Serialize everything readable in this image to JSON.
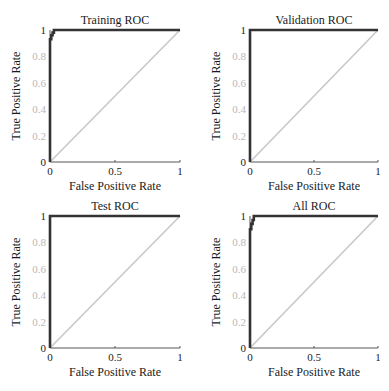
{
  "chart_data": [
    {
      "type": "line",
      "title": "Training ROC",
      "xlabel": "False Positive Rate",
      "ylabel": "True Positive Rate",
      "xlim": [
        0,
        1
      ],
      "ylim": [
        0,
        1
      ],
      "xticks": [
        "0",
        "0.5",
        "1"
      ],
      "yticks": [
        "0",
        "0.2",
        "0.4",
        "0.6",
        "0.8",
        "1"
      ],
      "grid": false,
      "series": [
        {
          "name": "ROC",
          "color": "#333333",
          "x": [
            0,
            0,
            0.01,
            0.01,
            0.02,
            0.02,
            0.03,
            0.03,
            1
          ],
          "y": [
            0,
            0.93,
            0.93,
            0.96,
            0.96,
            0.98,
            0.98,
            1,
            1
          ]
        },
        {
          "name": "Chance",
          "color": "#c8c8c8",
          "x": [
            0,
            1
          ],
          "y": [
            0,
            1
          ]
        }
      ]
    },
    {
      "type": "line",
      "title": "Validation ROC",
      "xlabel": "False Positive Rate",
      "ylabel": "True Positive Rate",
      "xlim": [
        0,
        1
      ],
      "ylim": [
        0,
        1
      ],
      "xticks": [
        "0",
        "0.5",
        "1"
      ],
      "yticks": [
        "0",
        "0.2",
        "0.4",
        "0.6",
        "0.8",
        "1"
      ],
      "grid": false,
      "series": [
        {
          "name": "ROC",
          "color": "#333333",
          "x": [
            0,
            0,
            1
          ],
          "y": [
            0,
            1,
            1
          ]
        },
        {
          "name": "Chance",
          "color": "#c8c8c8",
          "x": [
            0,
            1
          ],
          "y": [
            0,
            1
          ]
        }
      ]
    },
    {
      "type": "line",
      "title": "Test ROC",
      "xlabel": "False Positive Rate",
      "ylabel": "True Positive Rate",
      "xlim": [
        0,
        1
      ],
      "ylim": [
        0,
        1
      ],
      "xticks": [
        "0",
        "0.5",
        "1"
      ],
      "yticks": [
        "0",
        "0.2",
        "0.4",
        "0.6",
        "0.8",
        "1"
      ],
      "grid": false,
      "series": [
        {
          "name": "ROC",
          "color": "#333333",
          "x": [
            0,
            0,
            1
          ],
          "y": [
            0,
            1,
            1
          ]
        },
        {
          "name": "Chance",
          "color": "#c8c8c8",
          "x": [
            0,
            1
          ],
          "y": [
            0,
            1
          ]
        }
      ]
    },
    {
      "type": "line",
      "title": "All ROC",
      "xlabel": "False Positive Rate",
      "ylabel": "True Positive Rate",
      "xlim": [
        0,
        1
      ],
      "ylim": [
        0,
        1
      ],
      "xticks": [
        "0",
        "0.5",
        "1"
      ],
      "yticks": [
        "0",
        "0.2",
        "0.4",
        "0.6",
        "0.8",
        "1"
      ],
      "grid": false,
      "series": [
        {
          "name": "ROC",
          "color": "#333333",
          "x": [
            0,
            0,
            0.01,
            0.01,
            0.02,
            0.02,
            0.03,
            0.03,
            1
          ],
          "y": [
            0,
            0.9,
            0.9,
            0.94,
            0.94,
            0.97,
            0.97,
            1,
            1
          ]
        },
        {
          "name": "Chance",
          "color": "#c8c8c8",
          "x": [
            0,
            1
          ],
          "y": [
            0,
            1
          ]
        }
      ]
    }
  ],
  "layout": {
    "panels": [
      {
        "x0": 50,
        "x1": 180,
        "ytop": 30,
        "ybot": 162
      },
      {
        "x0": 250,
        "x1": 378,
        "ytop": 30,
        "ybot": 162
      },
      {
        "x0": 50,
        "x1": 180,
        "ytop": 216,
        "ybot": 348
      },
      {
        "x0": 250,
        "x1": 378,
        "ytop": 216,
        "ybot": 348
      }
    ]
  }
}
